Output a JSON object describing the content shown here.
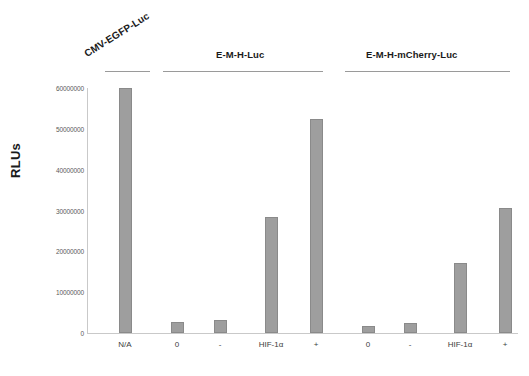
{
  "chart_data": {
    "type": "bar",
    "title": "",
    "xlabel": "",
    "ylabel": "RLUs",
    "ylim": [
      0,
      60000000
    ],
    "grid": false,
    "legend": null,
    "ytick_labels": [
      "60000000",
      "50000000",
      "40000000",
      "30000000",
      "20000000",
      "10000000",
      "0"
    ],
    "ytick_values": [
      60000000,
      50000000,
      40000000,
      30000000,
      20000000,
      10000000,
      0
    ],
    "categories": [
      "N/A",
      "0",
      "-",
      "HIF-1α",
      "+",
      "0",
      "-",
      "HIF-1α",
      "+"
    ],
    "values": [
      60000000,
      2700000,
      3200000,
      28500000,
      52300000,
      1700000,
      2450000,
      17100000,
      30700000
    ],
    "bar_color": "#9e9e9e",
    "bar_edge_color": "#8a8a8a",
    "groups": [
      {
        "label": "CMV-EGFP-Luc",
        "rotated": true,
        "categories": [
          "N/A"
        ]
      },
      {
        "label": "E-M-H-Luc",
        "rotated": false,
        "categories": [
          "0",
          "-",
          "HIF-1α",
          "+"
        ]
      },
      {
        "label": "E-M-H-mCherry-Luc",
        "rotated": false,
        "categories": [
          "0",
          "-",
          "HIF-1α",
          "+"
        ]
      }
    ],
    "bars": [
      {
        "category": "N/A",
        "value": 60000000,
        "group": "CMV-EGFP-Luc"
      },
      {
        "category": "0",
        "value": 2700000,
        "group": "E-M-H-Luc"
      },
      {
        "category": "-",
        "value": 3200000,
        "group": "E-M-H-Luc"
      },
      {
        "category": "HIF-1α",
        "value": 28500000,
        "group": "E-M-H-Luc"
      },
      {
        "category": "+",
        "value": 52300000,
        "group": "E-M-H-Luc"
      },
      {
        "category": "0",
        "value": 1700000,
        "group": "E-M-H-mCherry-Luc"
      },
      {
        "category": "-",
        "value": 2450000,
        "group": "E-M-H-mCherry-Luc"
      },
      {
        "category": "HIF-1α",
        "value": 17100000,
        "group": "E-M-H-mCherry-Luc"
      },
      {
        "category": "+",
        "value": 30700000,
        "group": "E-M-H-mCherry-Luc"
      }
    ]
  }
}
